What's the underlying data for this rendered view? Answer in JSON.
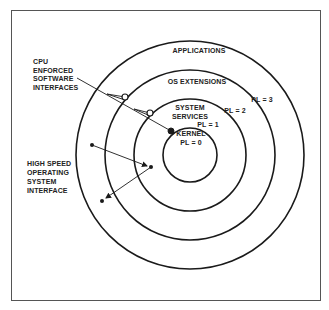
{
  "diagram": {
    "rings": [
      {
        "name": "kernel",
        "label_lines": [
          "KERNEL",
          "PL = 0"
        ],
        "radius": 27
      },
      {
        "name": "system-services",
        "label_lines": [
          "SYSTEM",
          "SERVICES"
        ],
        "pl_label": "PL = 1",
        "radius": 56
      },
      {
        "name": "os-extensions",
        "label_lines": [
          "OS EXTENSIONS"
        ],
        "pl_label": "PL = 2",
        "radius": 85
      },
      {
        "name": "applications",
        "label_lines": [
          "APPLICATIONS"
        ],
        "pl_label": "PL = 3",
        "radius": 114
      }
    ],
    "annotations": {
      "cpu_enforced": [
        "CPU",
        "ENFORCED",
        "SOFTWARE",
        "INTERFACES"
      ],
      "high_speed": [
        "HIGH SPEED",
        "OPERATING",
        "SYSTEM",
        "INTERFACE"
      ]
    },
    "colors": {
      "line": "#1a1a1a",
      "frame": "#555555",
      "background": "#ffffff"
    }
  }
}
